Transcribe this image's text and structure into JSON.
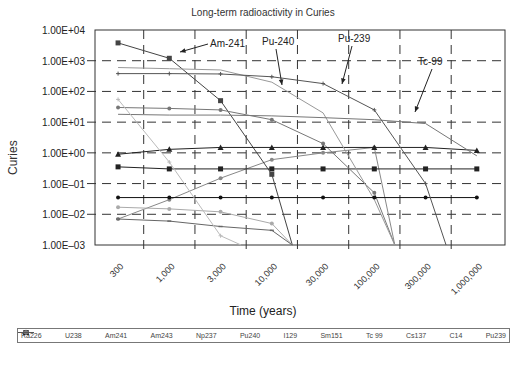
{
  "chart_data": {
    "type": "line",
    "title": "Long-term radioactivity in Curies",
    "xlabel": "Time (years)",
    "ylabel": "Curies",
    "yscale": "log",
    "ylim": [
      0.001,
      10000
    ],
    "grid": true,
    "legend_position": "bottom",
    "y_tick_labels": [
      "1.00E+04",
      "1.00E+03",
      "1.00E+02",
      "1.00E+01",
      "1.00E+00",
      "1.00E–01",
      "1.00E–02",
      "1.00E–03"
    ],
    "x_tick_labels": [
      "300",
      "1,000",
      "3,000",
      "10,000",
      "30,000",
      "100,000",
      "300,000",
      "1,000,000"
    ],
    "x": [
      300,
      1000,
      3000,
      10000,
      30000,
      100000,
      300000,
      1000000
    ],
    "series": [
      {
        "name": "Ra226",
        "values": [
          0.007,
          0.03,
          0.15,
          0.6,
          1.0,
          1.5,
          null,
          null
        ]
      },
      {
        "name": "U238",
        "values": [
          0.35,
          0.3,
          0.3,
          0.3,
          0.3,
          0.3,
          0.3,
          0.3
        ]
      },
      {
        "name": "Am241",
        "values": [
          3800,
          1200,
          50,
          0.2,
          null,
          null,
          null,
          null
        ]
      },
      {
        "name": "Am243",
        "values": [
          30,
          28,
          25,
          12,
          2,
          0.05,
          null,
          null
        ]
      },
      {
        "name": "Np237",
        "values": [
          0.9,
          1.3,
          1.5,
          1.5,
          1.5,
          1.5,
          1.5,
          1.2
        ]
      },
      {
        "name": "Pu240",
        "values": [
          600,
          550,
          500,
          200,
          20,
          0.03,
          null,
          null
        ]
      },
      {
        "name": "I129",
        "values": [
          0.035,
          0.035,
          0.035,
          0.035,
          0.035,
          0.035,
          0.035,
          0.035
        ]
      },
      {
        "name": "Sm151",
        "values": [
          0.017,
          0.015,
          0.012,
          0.005,
          null,
          null,
          null,
          null
        ]
      },
      {
        "name": "Tc 99",
        "values": [
          18,
          17,
          17,
          16,
          14,
          12,
          9,
          0.8
        ]
      },
      {
        "name": "Cs137",
        "values": [
          0.007,
          0.006,
          0.004,
          0.003,
          null,
          null,
          null,
          null
        ]
      },
      {
        "name": "C14",
        "values": [
          55,
          0.5,
          0.002,
          null,
          null,
          null,
          null,
          null
        ]
      },
      {
        "name": "Pu239",
        "values": [
          380,
          380,
          370,
          300,
          180,
          25,
          0.1,
          null
        ]
      }
    ],
    "annotations": [
      "Am-241",
      "Pu-240",
      "Pu-239",
      "Tc-99"
    ]
  },
  "legend": [
    {
      "label": "Ra226",
      "color": "#888888",
      "marker": "dot"
    },
    {
      "label": "U238",
      "color": "#222222",
      "marker": "square"
    },
    {
      "label": "Am241",
      "color": "#444444",
      "marker": "square"
    },
    {
      "label": "Am243",
      "color": "#777777",
      "marker": "dot"
    },
    {
      "label": "Np237",
      "color": "#222222",
      "marker": "triangle"
    },
    {
      "label": "Pu240",
      "color": "#999999",
      "marker": "none"
    },
    {
      "label": "I129",
      "color": "#111111",
      "marker": "dot"
    },
    {
      "label": "Sm151",
      "color": "#aaaaaa",
      "marker": "dot"
    },
    {
      "label": "Tc 99",
      "color": "#777777",
      "marker": "none"
    },
    {
      "label": "Cs137",
      "color": "#666666",
      "marker": "dash"
    },
    {
      "label": "C14",
      "color": "#bbbbbb",
      "marker": "plus"
    },
    {
      "label": "Pu239",
      "color": "#555555",
      "marker": "plus"
    }
  ]
}
